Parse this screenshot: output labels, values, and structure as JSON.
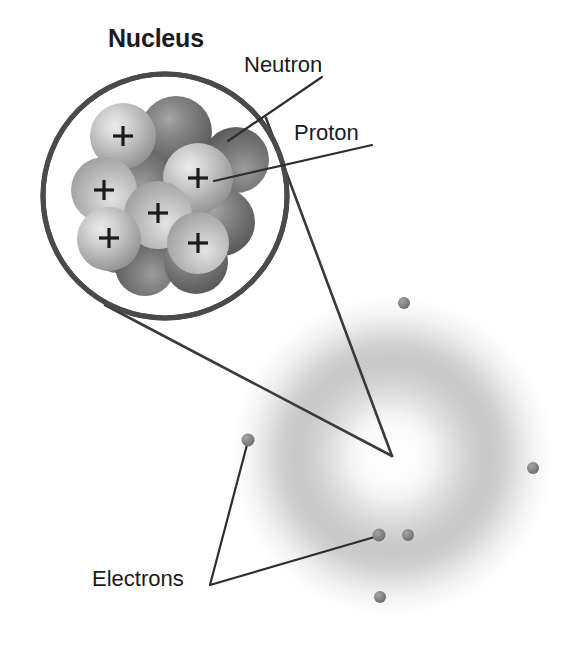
{
  "diagram": {
    "background_color": "#ffffff",
    "width": 575,
    "height": 645
  },
  "labels": {
    "nucleus": "Nucleus",
    "neutron": "Neutron",
    "proton": "Proton",
    "electrons": "Electrons"
  },
  "colors": {
    "text": "#1b1b1b",
    "leader_line": "#3a3a3a",
    "magnifier_ring": "#4a4a4a",
    "proton_sphere": "#b9b9b9",
    "proton_sphere_highlight": "#e6e6e6",
    "neutron_sphere": "#6f6f6f",
    "neutron_sphere_highlight": "#a8a8a8",
    "electron_dot": "#8a8a8a",
    "electron_cloud": "#bdbdbd",
    "charge_symbol": "#1b1b1b"
  },
  "magnifier": {
    "center_x": 165,
    "center_y": 196,
    "radius": 122,
    "ring_width": 5,
    "focus_point_x": 392,
    "focus_point_y": 456
  },
  "nucleus": {
    "particle_radius": 33,
    "charge_symbol": "+",
    "particles": [
      {
        "type": "neutron",
        "cx": 176,
        "cy": 132,
        "r": 36,
        "layer": 1
      },
      {
        "type": "neutron",
        "cx": 236,
        "cy": 160,
        "r": 33,
        "layer": 1
      },
      {
        "type": "neutron",
        "cx": 133,
        "cy": 176,
        "r": 34,
        "layer": 1
      },
      {
        "type": "neutron",
        "cx": 221,
        "cy": 222,
        "r": 34,
        "layer": 1
      },
      {
        "type": "neutron",
        "cx": 160,
        "cy": 243,
        "r": 33,
        "layer": 1
      },
      {
        "type": "neutron",
        "cx": 118,
        "cy": 243,
        "r": 30,
        "layer": 1
      },
      {
        "type": "neutron",
        "cx": 196,
        "cy": 262,
        "r": 32,
        "layer": 1
      },
      {
        "type": "neutron",
        "cx": 145,
        "cy": 266,
        "r": 30,
        "layer": 1
      },
      {
        "type": "proton",
        "cx": 123,
        "cy": 136,
        "r": 33,
        "layer": 2
      },
      {
        "type": "proton",
        "cx": 198,
        "cy": 178,
        "r": 35,
        "layer": 2
      },
      {
        "type": "proton",
        "cx": 104,
        "cy": 190,
        "r": 33,
        "layer": 2
      },
      {
        "type": "proton",
        "cx": 158,
        "cy": 215,
        "r": 34,
        "layer": 2
      },
      {
        "type": "proton",
        "cx": 109,
        "cy": 239,
        "r": 32,
        "layer": 2
      },
      {
        "type": "proton",
        "cx": 198,
        "cy": 243,
        "r": 31,
        "layer": 2
      }
    ],
    "proton_count": 6,
    "neutron_count": 8
  },
  "electron_cloud": {
    "center_x": 392,
    "center_y": 456,
    "outer_radius": 165,
    "inner_radius": 62,
    "peak_radius": 118
  },
  "electrons": [
    {
      "id": "electron-top",
      "cx": 404,
      "cy": 303,
      "r": 6
    },
    {
      "id": "electron-right",
      "cx": 533,
      "cy": 468,
      "r": 6
    },
    {
      "id": "electron-lower-left",
      "cx": 248,
      "cy": 440,
      "r": 6,
      "labeled": true
    },
    {
      "id": "electron-bottom-inner-left",
      "cx": 379,
      "cy": 535,
      "r": 6,
      "labeled": true
    },
    {
      "id": "electron-bottom-inner-right",
      "cx": 408,
      "cy": 535,
      "r": 6
    },
    {
      "id": "electron-bottom",
      "cx": 380,
      "cy": 597,
      "r": 6
    }
  ],
  "leader_lines": [
    {
      "name": "neutron-leader",
      "x1": 322,
      "y1": 77,
      "x2": 228,
      "y2": 141
    },
    {
      "name": "proton-leader",
      "x1": 372,
      "y1": 145,
      "x2": 214,
      "y2": 181
    },
    {
      "name": "magnifier-connector-top",
      "x1": 266,
      "y1": 118,
      "x2": 392,
      "y2": 456
    },
    {
      "name": "magnifier-connector-bottom",
      "x1": 105,
      "y1": 305,
      "x2": 392,
      "y2": 456
    },
    {
      "name": "electrons-leader-left",
      "x1": 210,
      "y1": 585,
      "x2": 248,
      "y2": 441
    },
    {
      "name": "electrons-leader-right",
      "x1": 210,
      "y1": 585,
      "x2": 378,
      "y2": 536
    }
  ]
}
